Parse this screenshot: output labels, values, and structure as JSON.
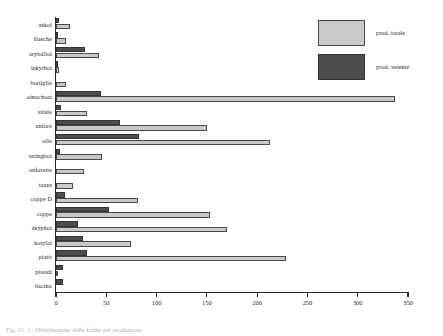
{
  "figure": {
    "caption": "Fig. 21. 1 - Distribuzione delle forme per produzione"
  },
  "legend": {
    "position": "top-right",
    "items": [
      {
        "label": "prod. totale",
        "color": "#c9c9c9",
        "key": "total"
      },
      {
        "label": "prod. veiente",
        "color": "#4d4d4d",
        "key": "veiente"
      }
    ]
  },
  "axis": {
    "x_ticks": [
      0,
      50,
      100,
      150,
      200,
      250,
      300,
      350
    ],
    "xlim": [
      0,
      350
    ]
  },
  "chart_data": {
    "type": "bar",
    "orientation": "horizontal",
    "title": "",
    "xlabel": "",
    "ylabel": "",
    "xlim": [
      0,
      350
    ],
    "xticks": [
      0,
      50,
      100,
      150,
      200,
      250,
      300,
      350
    ],
    "grid": false,
    "legend_position": "top-right",
    "categories": [
      "askoi",
      "fiasche",
      "aryballoi",
      "lekythoi",
      "bottiglie",
      "oinochoai",
      "situle",
      "anfore",
      "olle",
      "attingitoi",
      "anforette",
      "tazze",
      "coppe D",
      "coppe",
      "skyphoi",
      "kotylai",
      "piatti",
      "pissidi",
      "bacino"
    ],
    "series": [
      {
        "name": "prod. totale",
        "color": "#c9c9c9",
        "values": [
          14,
          10,
          43,
          3,
          10,
          337,
          31,
          150,
          213,
          46,
          28,
          17,
          82,
          153,
          170,
          75,
          229,
          2,
          0
        ]
      },
      {
        "name": "prod. veiente",
        "color": "#4d4d4d",
        "values": [
          3,
          2,
          29,
          1,
          0,
          45,
          5,
          64,
          83,
          4,
          0,
          0,
          9,
          53,
          22,
          27,
          31,
          7,
          7
        ]
      }
    ]
  }
}
